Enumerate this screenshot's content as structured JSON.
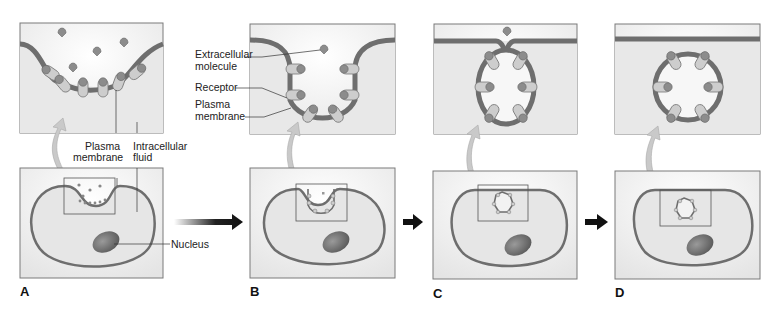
{
  "figure": {
    "panels": [
      {
        "letter": "A"
      },
      {
        "letter": "B"
      },
      {
        "letter": "C"
      },
      {
        "letter": "D"
      }
    ]
  },
  "labels": {
    "panel_a": {
      "plasma_membrane_line1": "Plasma",
      "plasma_membrane_line2": "membrane",
      "intracellular_line1": "Intracellular",
      "intracellular_line2": "fluid",
      "nucleus": "Nucleus"
    },
    "panel_b": {
      "extracellular_line1": "Extracellular",
      "extracellular_line2": "molecule",
      "receptor": "Receptor",
      "plasma_membrane_line1": "Plasma",
      "plasma_membrane_line2": "membrane"
    }
  },
  "colors": {
    "membrane": "#6e6e6e",
    "receptor": "#c8c8c8",
    "molecule": "#8a8a8a",
    "cell_fill": "#e6e6e6",
    "box_fill": "#eeeeee",
    "box_stroke": "#7a7a7a",
    "nucleus": "#6a6a6a",
    "arrow": "#111111"
  }
}
